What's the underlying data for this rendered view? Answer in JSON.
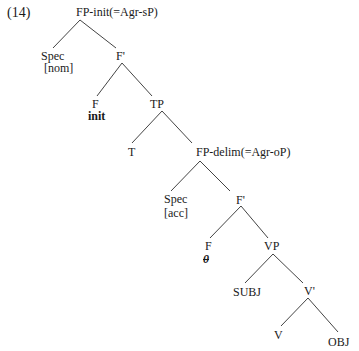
{
  "example_number": "(14)",
  "tree": {
    "root": "FP-init(=Agr-sP)",
    "spec_nom": {
      "label": "Spec",
      "case": "[nom]"
    },
    "fbar_top": "F'",
    "f_init": {
      "label": "F",
      "feature": "init"
    },
    "tp": "TP",
    "t": "T",
    "fp_delim": "FP-delim(=Agr-oP)",
    "spec_acc": {
      "label": "Spec",
      "case": "[acc]"
    },
    "fbar_low": "F'",
    "f_null": {
      "label": "F",
      "feature": "0"
    },
    "vp": "VP",
    "subj": "SUBJ",
    "vbar": "V'",
    "v": "V",
    "obj": "OBJ"
  }
}
